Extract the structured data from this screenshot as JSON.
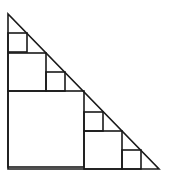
{
  "diagram": {
    "stroke_color": "#1a1a1a",
    "background": "#ffffff",
    "triangle": {
      "points": [
        [
          8,
          14
        ],
        [
          8,
          169
        ],
        [
          159,
          169
        ]
      ]
    },
    "squares": [
      {
        "level": 1,
        "x": 8,
        "y": 91,
        "size": 76
      },
      {
        "level": 2,
        "x": 8,
        "y": 53,
        "size": 38
      },
      {
        "level": 2,
        "x": 84,
        "y": 131,
        "size": 38
      },
      {
        "level": 3,
        "x": 8,
        "y": 33,
        "size": 19
      },
      {
        "level": 3,
        "x": 46,
        "y": 72,
        "size": 19
      },
      {
        "level": 3,
        "x": 84,
        "y": 112,
        "size": 19
      },
      {
        "level": 3,
        "x": 122,
        "y": 150,
        "size": 19
      }
    ]
  }
}
